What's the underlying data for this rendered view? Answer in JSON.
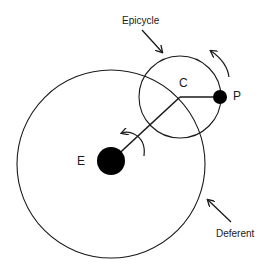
{
  "diagram": {
    "type": "epicycle-deferent",
    "labels": {
      "epicycle": "Epicycle",
      "deferent": "Deferent",
      "earth": "E",
      "center": "C",
      "planet": "P"
    },
    "colors": {
      "stroke": "#1a1a1a",
      "fill": "#000000",
      "background": "#ffffff"
    }
  }
}
